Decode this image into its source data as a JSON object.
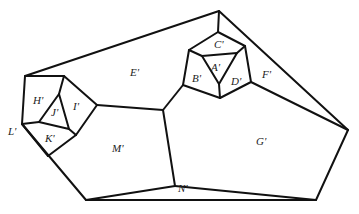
{
  "diagram": {
    "type": "planar-graph-dual",
    "line_color": "#111111",
    "background": "#ffffff",
    "regions": [
      {
        "id": "A",
        "label": "A'",
        "x": 215,
        "y": 68
      },
      {
        "id": "B",
        "label": "B'",
        "x": 193,
        "y": 78
      },
      {
        "id": "C",
        "label": "C'",
        "x": 216,
        "y": 47
      },
      {
        "id": "D",
        "label": "D'",
        "x": 233,
        "y": 84
      },
      {
        "id": "E",
        "label": "E'",
        "x": 131,
        "y": 74
      },
      {
        "id": "F",
        "label": "F'",
        "x": 262,
        "y": 76
      },
      {
        "id": "G",
        "label": "G'",
        "x": 256,
        "y": 143
      },
      {
        "id": "H",
        "label": "H'",
        "x": 32,
        "y": 101
      },
      {
        "id": "I",
        "label": "I'",
        "x": 73,
        "y": 108
      },
      {
        "id": "J",
        "label": "J'",
        "x": 50,
        "y": 114
      },
      {
        "id": "K",
        "label": "K'",
        "x": 44,
        "y": 140
      },
      {
        "id": "L",
        "label": "L'",
        "x": 8,
        "y": 133
      },
      {
        "id": "M",
        "label": "M'",
        "x": 112,
        "y": 150
      },
      {
        "id": "N",
        "label": "N'",
        "x": 180,
        "y": 190
      }
    ]
  }
}
